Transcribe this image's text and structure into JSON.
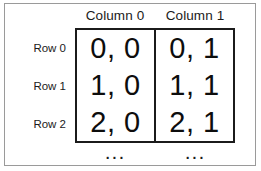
{
  "figure": {
    "colors": {
      "outer_border": "#9a9a9a",
      "grid_border": "#1b1b1b",
      "text": "#1b1b1b",
      "background": "#ffffff"
    }
  },
  "headers": {
    "columns": [
      {
        "label": "Column 0"
      },
      {
        "label": "Column 1"
      }
    ]
  },
  "rows": {
    "labels": [
      {
        "label": "Row 0"
      },
      {
        "label": "Row 1"
      },
      {
        "label": "Row 2"
      }
    ]
  },
  "grid": {
    "cells": [
      [
        {
          "value": "0, 0"
        },
        {
          "value": "0, 1"
        }
      ],
      [
        {
          "value": "1, 0"
        },
        {
          "value": "1, 1"
        }
      ],
      [
        {
          "value": "2, 0"
        },
        {
          "value": "2, 1"
        }
      ]
    ]
  },
  "continuation": {
    "marks": [
      {
        "glyph": "..."
      },
      {
        "glyph": "..."
      }
    ]
  }
}
